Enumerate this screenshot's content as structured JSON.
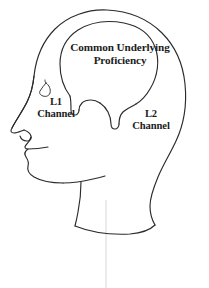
{
  "diagram": {
    "background_color": "#ffffff",
    "line_color": "#2b2b2b",
    "text_color": "#1c1c1c"
  },
  "labels": {
    "cup": {
      "line1": "Common Underlying",
      "line2": "Proficiency"
    },
    "l1_channel": {
      "line1": "L1",
      "line2": "Channel"
    },
    "l2_channel": {
      "line1": "L2",
      "line2": "Channel"
    }
  },
  "shapes": {
    "head_profile": "human head drawn in left-facing profile outline",
    "brain_region": "large rounded balloon shape inside the skull labelled Common Underlying Proficiency",
    "left_channel_prong": "narrow downward prong from the brain toward the front of the head",
    "right_channel_prong": "narrow downward prong from the brain toward the rear of the head",
    "eye": "small triangular eye outline",
    "nose": "profile nose with nostril",
    "lips": "profile upper and lower lip",
    "chin": "profile chin",
    "jaw": "jaw line running back from the chin",
    "neck": "neck with collar cut-off curve"
  }
}
